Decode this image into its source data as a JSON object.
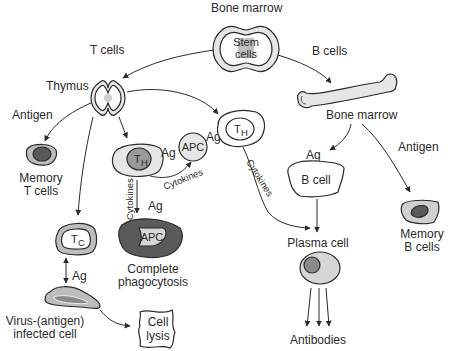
{
  "diagram": {
    "colors": {
      "stroke": "#2a2a2a",
      "light_fill": "#e6e6e6",
      "mid_fill": "#bdbdbd",
      "dark_fill": "#5a5a5a",
      "nucleus_fill": "#8a8a8a",
      "text": "#2a2a2a"
    },
    "nodes": {
      "bone_marrow_top": {
        "label": "Bone marrow"
      },
      "stem_cells": {
        "line1": "Stem",
        "line2": "cells"
      },
      "t_cells_label": {
        "label": "T cells"
      },
      "b_cells_label": {
        "label": "B cells"
      },
      "thymus": {
        "label": "Thymus"
      },
      "antigen_left": {
        "label": "Antigen"
      },
      "memory_t": {
        "line1": "Memory",
        "line2": "T cells"
      },
      "th_left": {
        "main": "T",
        "sub": "H"
      },
      "ag_th_apc": {
        "label": "Ag"
      },
      "apc": {
        "label": "APC"
      },
      "ag_apc_th": {
        "label": "Ag"
      },
      "th_right": {
        "main": "T",
        "sub": "H"
      },
      "cytokines_curve": {
        "label": "Cytokines"
      },
      "cytokines_vertical": {
        "label": "Cytokines"
      },
      "ag_vertical": {
        "label": "Ag"
      },
      "apc_phago": {
        "label": "APC"
      },
      "complete_phago": {
        "line1": "Complete",
        "line2": "phagocytosis"
      },
      "tc": {
        "main": "T",
        "sub": "C"
      },
      "ag_tc": {
        "label": "Ag"
      },
      "infected_cell": {
        "line1": "Virus-(antigen)",
        "line2": "infected cell"
      },
      "cell_lysis": {
        "line1": "Cell",
        "line2": "lysis"
      },
      "bone_marrow_right": {
        "label": "Bone marrow"
      },
      "ag_bcell": {
        "label": "Ag"
      },
      "antigen_right": {
        "label": "Antigen"
      },
      "b_cell": {
        "label": "B cell"
      },
      "cytokines_th_plasma": {
        "label": "Cytokines"
      },
      "plasma_cell": {
        "label": "Plasma cell"
      },
      "antibodies": {
        "label": "Antibodies"
      },
      "memory_b": {
        "line1": "Memory",
        "line2": "B cells"
      }
    }
  }
}
